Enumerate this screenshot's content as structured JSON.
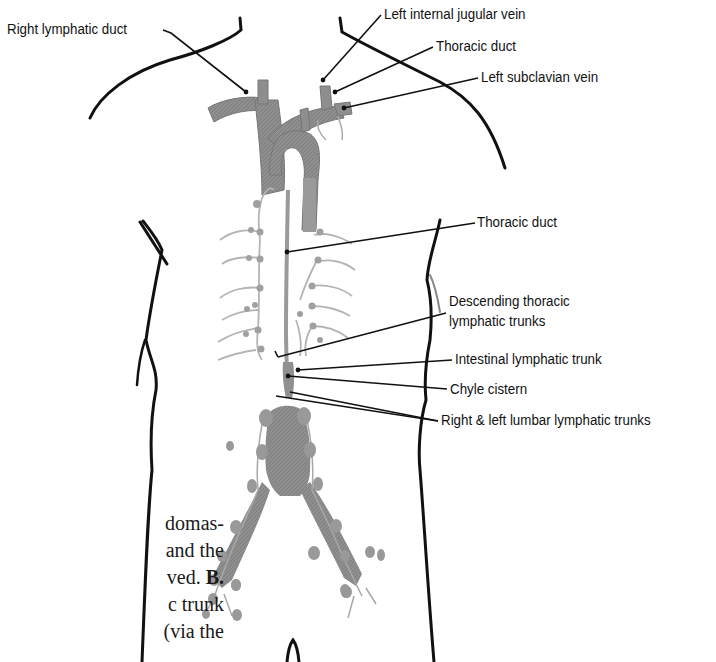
{
  "figure": {
    "type": "anatomical-diagram",
    "colors": {
      "outline": "#111111",
      "vessel_fill": "#8c8c8c",
      "vessel_light": "#a8a8a8",
      "lymph_node": "#9a9a9a",
      "lymph_vessel": "#b4b4b4",
      "leader_line": "#111111",
      "text": "#111111"
    },
    "labels": [
      {
        "id": "right-lymphatic-duct",
        "text": "Right lymphatic duct"
      },
      {
        "id": "left-internal-jugular-vein",
        "text": "Left internal jugular vein"
      },
      {
        "id": "thoracic-duct-upper",
        "text": "Thoracic duct"
      },
      {
        "id": "left-subclavian-vein",
        "text": "Left subclavian vein"
      },
      {
        "id": "thoracic-duct-mid",
        "text": "Thoracic duct"
      },
      {
        "id": "descending-thoracic-lymphatic-trunks-1",
        "text": "Descending thoracic"
      },
      {
        "id": "descending-thoracic-lymphatic-trunks-2",
        "text": "lymphatic trunks"
      },
      {
        "id": "intestinal-lymphatic-trunk",
        "text": "Intestinal lymphatic trunk"
      },
      {
        "id": "chyle-cistern",
        "text": "Chyle cistern"
      },
      {
        "id": "right-left-lumbar-lymphatic-trunks",
        "text": "Right & left lumbar lymphatic trunks"
      }
    ]
  },
  "caption": {
    "lines": [
      {
        "text": "domas-",
        "bold": ""
      },
      {
        "text": "and the",
        "bold": ""
      },
      {
        "text": "ved. ",
        "bold": "B."
      },
      {
        "text": "c trunk",
        "bold": ""
      },
      {
        "text": "(via the",
        "bold": ""
      }
    ]
  }
}
